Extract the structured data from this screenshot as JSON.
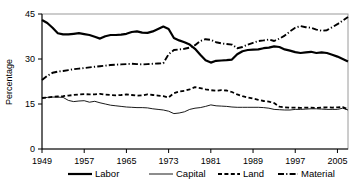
{
  "chart_data": {
    "type": "line",
    "title": "",
    "xlabel": "",
    "ylabel": "Percentage",
    "xlim": [
      1949,
      2007
    ],
    "ylim": [
      0,
      45
    ],
    "yticks": [
      0,
      15,
      30,
      45
    ],
    "xticks": [
      1949,
      1957,
      1965,
      1973,
      1981,
      1989,
      1997,
      2005
    ],
    "grid": false,
    "legend_position": "bottom",
    "x": [
      1949,
      1950,
      1951,
      1952,
      1953,
      1954,
      1955,
      1956,
      1957,
      1958,
      1959,
      1960,
      1961,
      1962,
      1963,
      1964,
      1965,
      1966,
      1967,
      1968,
      1969,
      1970,
      1971,
      1972,
      1973,
      1974,
      1975,
      1976,
      1977,
      1978,
      1979,
      1980,
      1981,
      1982,
      1983,
      1984,
      1985,
      1986,
      1987,
      1988,
      1989,
      1990,
      1991,
      1992,
      1993,
      1994,
      1995,
      1996,
      1997,
      1998,
      1999,
      2000,
      2001,
      2002,
      2003,
      2004,
      2005,
      2006,
      2007
    ],
    "series": [
      {
        "name": "Labor",
        "style": "thick-solid",
        "color": "#000000",
        "values": [
          43.0,
          42.0,
          40.4,
          38.6,
          38.2,
          38.2,
          38.4,
          38.6,
          38.3,
          38.0,
          37.4,
          36.8,
          37.6,
          38.0,
          38.0,
          38.1,
          38.4,
          39.0,
          39.2,
          38.8,
          38.7,
          39.2,
          40.0,
          40.8,
          40.0,
          37.0,
          36.2,
          35.6,
          34.8,
          33.4,
          31.4,
          29.6,
          28.8,
          29.4,
          29.5,
          29.6,
          29.8,
          31.6,
          32.6,
          33.0,
          33.1,
          33.2,
          33.6,
          33.8,
          34.2,
          34.0,
          33.2,
          32.8,
          32.3,
          32.0,
          32.2,
          32.4,
          32.0,
          32.2,
          32.0,
          31.4,
          30.8,
          30.0,
          29.2
        ]
      },
      {
        "name": "Capital",
        "style": "thin-solid",
        "color": "#000000",
        "values": [
          17.0,
          17.2,
          17.3,
          17.3,
          17.2,
          16.2,
          15.8,
          16.0,
          16.1,
          15.6,
          15.9,
          15.4,
          15.0,
          14.6,
          14.4,
          14.2,
          14.0,
          13.9,
          13.8,
          13.8,
          13.7,
          13.4,
          13.2,
          13.0,
          12.6,
          11.8,
          12.0,
          12.4,
          13.2,
          13.6,
          13.8,
          14.2,
          14.7,
          14.4,
          14.3,
          14.2,
          14.0,
          13.9,
          13.9,
          13.9,
          13.9,
          13.9,
          13.8,
          13.6,
          13.2,
          13.1,
          13.0,
          13.0,
          13.2,
          13.2,
          13.3,
          13.4,
          13.4,
          13.3,
          13.2,
          13.2,
          13.2,
          13.6,
          13.0
        ]
      },
      {
        "name": "Land",
        "style": "dashed",
        "color": "#000000",
        "values": [
          17.0,
          17.2,
          17.4,
          17.5,
          17.6,
          17.8,
          18.0,
          18.2,
          18.3,
          18.2,
          18.2,
          18.4,
          18.1,
          18.0,
          17.9,
          18.0,
          18.2,
          18.0,
          17.8,
          17.9,
          18.2,
          18.0,
          17.8,
          17.6,
          17.2,
          18.6,
          19.2,
          19.4,
          19.9,
          20.6,
          20.3,
          19.9,
          19.6,
          19.4,
          19.6,
          19.5,
          19.0,
          18.2,
          17.6,
          17.2,
          16.8,
          16.4,
          16.0,
          15.8,
          15.3,
          14.1,
          13.9,
          13.8,
          13.8,
          13.7,
          13.8,
          13.8,
          13.7,
          13.8,
          13.9,
          13.8,
          13.9,
          14.0,
          13.2
        ]
      },
      {
        "name": "Material",
        "style": "dash-dot",
        "color": "#000000",
        "values": [
          23.0,
          24.4,
          25.4,
          25.8,
          26.0,
          26.3,
          26.6,
          26.8,
          27.0,
          27.2,
          27.4,
          27.6,
          27.8,
          28.0,
          28.1,
          28.2,
          28.3,
          28.4,
          28.3,
          28.2,
          28.3,
          28.4,
          28.5,
          28.6,
          31.6,
          33.0,
          33.2,
          33.4,
          33.8,
          34.6,
          36.0,
          36.6,
          36.4,
          35.6,
          35.2,
          35.0,
          34.8,
          33.6,
          34.0,
          34.8,
          35.4,
          36.0,
          36.2,
          36.5,
          36.0,
          36.8,
          37.8,
          39.2,
          40.4,
          41.0,
          40.6,
          40.4,
          39.8,
          39.4,
          39.6,
          40.6,
          41.6,
          42.8,
          44.0
        ]
      }
    ]
  },
  "legend": {
    "items": [
      {
        "label": "Labor"
      },
      {
        "label": "Capital"
      },
      {
        "label": "Land"
      },
      {
        "label": "Material"
      }
    ]
  },
  "axes": {
    "y_label": "Percentage",
    "y_ticks": [
      "45",
      "30",
      "15",
      "0"
    ],
    "x_ticks": [
      "1949",
      "1957",
      "1965",
      "1973",
      "1981",
      "1989",
      "1997",
      "2005"
    ]
  }
}
